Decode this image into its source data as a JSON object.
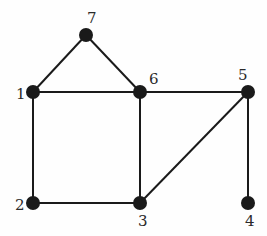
{
  "diagram": {
    "type": "undirected-graph",
    "nodes": [
      {
        "id": "1",
        "label": "1",
        "x": 33,
        "y": 92,
        "lx": 16,
        "ly": 99
      },
      {
        "id": "2",
        "label": "2",
        "x": 33,
        "y": 203,
        "lx": 15,
        "ly": 210
      },
      {
        "id": "3",
        "label": "3",
        "x": 140,
        "y": 203,
        "lx": 138,
        "ly": 226
      },
      {
        "id": "4",
        "label": "4",
        "x": 248,
        "y": 203,
        "lx": 245,
        "ly": 226
      },
      {
        "id": "5",
        "label": "5",
        "x": 248,
        "y": 92,
        "lx": 238,
        "ly": 80
      },
      {
        "id": "6",
        "label": "6",
        "x": 140,
        "y": 92,
        "lx": 149,
        "ly": 84
      },
      {
        "id": "7",
        "label": "7",
        "x": 86,
        "y": 35,
        "lx": 87,
        "ly": 23
      }
    ],
    "edges": [
      [
        "1",
        "7"
      ],
      [
        "7",
        "6"
      ],
      [
        "1",
        "6"
      ],
      [
        "6",
        "5"
      ],
      [
        "1",
        "2"
      ],
      [
        "2",
        "3"
      ],
      [
        "6",
        "3"
      ],
      [
        "3",
        "5"
      ],
      [
        "5",
        "4"
      ]
    ],
    "node_color": "#1a1a1a",
    "edge_color": "#1a1a1a"
  }
}
